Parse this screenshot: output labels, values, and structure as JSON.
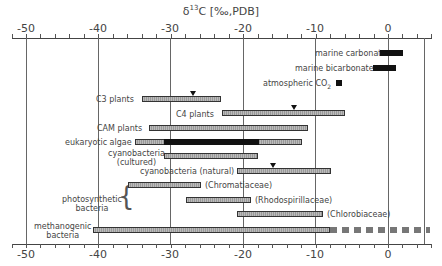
{
  "chart_data": {
    "type": "range-bar",
    "title": "δ13C [‰,PDB]",
    "title_parts": {
      "delta": "δ",
      "sup": "13",
      "rest": "C [‰,PDB]"
    },
    "xlabel": "δ13C [‰,PDB]",
    "ylabel": "",
    "xlim": [
      -50,
      5
    ],
    "x_ticks": [
      -50,
      -40,
      -30,
      -20,
      -10,
      0
    ],
    "x_tick_labels": [
      "-50",
      "-40",
      "-30",
      "-20",
      "-10",
      "0"
    ],
    "grid": "vertical lines at major ticks",
    "series": [
      {
        "name": "marine carbonate",
        "min": -1,
        "max": 2,
        "style": "solid-black"
      },
      {
        "name": "marine bicarbonate",
        "min": -2,
        "max": 1,
        "style": "solid-black"
      },
      {
        "name": "atmospheric CO2",
        "min": -7.5,
        "max": -6.5,
        "style": "solid-black"
      },
      {
        "name": "C3 plants",
        "min": -34,
        "max": -23,
        "marker": -27,
        "style": "hatched"
      },
      {
        "name": "C4 plants",
        "min": -23,
        "max": -6,
        "marker": -13,
        "style": "hatched"
      },
      {
        "name": "CAM plants",
        "min": -33,
        "max": -11,
        "style": "hatched"
      },
      {
        "name": "eukaryotic algae",
        "min": -35,
        "max": -12,
        "dense_min": -31,
        "dense_max": -18,
        "style": "hatched"
      },
      {
        "name": "cyanobacteria (cultured)",
        "min": -31,
        "max": -18,
        "style": "hatched"
      },
      {
        "name": "cyanobacteria (natural)",
        "min": -21,
        "max": -8,
        "marker": -16,
        "style": "hatched"
      },
      {
        "name": "photosynthetic bacteria (Chromatiaceae)",
        "min": -36,
        "max": -26,
        "style": "hatched"
      },
      {
        "name": "photosynthetic bacteria (Rhodospirillaceae)",
        "min": -28,
        "max": -19,
        "style": "hatched"
      },
      {
        "name": "photosynthetic bacteria (Chlorobiaceae)",
        "min": -21,
        "max": -9,
        "style": "hatched"
      },
      {
        "name": "methanogenic bacteria",
        "min": -41,
        "max": -8,
        "dashed_extension_to": 6,
        "style": "hatched"
      }
    ]
  },
  "labels": {
    "marine_carbonate": "marine carbonate",
    "marine_bicarbonate": "marine bicarbonate",
    "atmospheric_co2": "atmospheric CO",
    "atmospheric_co2_sub": "2",
    "c3": "C3 plants",
    "c4": "C4 plants",
    "cam": "CAM plants",
    "euk": "eukaryotic algae",
    "cyano_cult_1": "cyanobacteria",
    "cyano_cult_2": "(cultured)",
    "cyano_nat": "cyanobacteria (natural)",
    "photo_1": "photosynthetic",
    "photo_2": "bacteria",
    "chromat": "(Chromatiaceae)",
    "rhodo": "(Rhodospirillaceae)",
    "chloro": "(Chlorobiaceae)",
    "meth_1": "methanogenic",
    "meth_2": "bacteria"
  }
}
